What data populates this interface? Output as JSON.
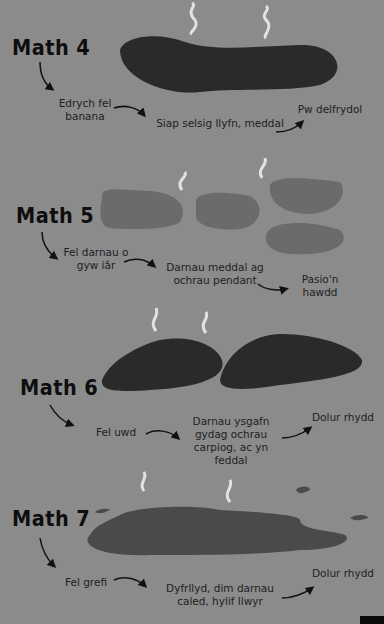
{
  "colors": {
    "background": "#8b8b8b",
    "dark_blob": "#2a2a2a",
    "light_blob": "#6b6b6b",
    "steam": "#e2e2e2",
    "text": "#1e1e1e"
  },
  "sections": [
    {
      "title": "Math 4",
      "labels": [
        "Edrych fel banana",
        "Siap selsig llyfn, meddal",
        "Pw delfrydol"
      ]
    },
    {
      "title": "Math 5",
      "labels": [
        "Fel darnau o gyw iâr",
        "Darnau meddal ag ochrau pendant",
        "Pasio'n hawdd"
      ]
    },
    {
      "title": "Math 6",
      "labels": [
        "Fel uwd",
        "Darnau ysgafn gydag ochrau carpiog, ac yn feddal",
        "Dolur rhydd"
      ]
    },
    {
      "title": "Math 7",
      "labels": [
        "Fel grefi",
        "Dyfrllyd, dim darnau caled, hylif llwyr",
        "Dolur rhydd"
      ]
    }
  ],
  "lines": {
    "m4_l1a": "Edrych fel",
    "m4_l1b": "banana",
    "m4_l2": "Siap selsig llyfn, meddal",
    "m4_l3": "Pw delfrydol",
    "m5_l1a": "Fel darnau o",
    "m5_l1b": "gyw iâr",
    "m5_l2a": "Darnau meddal ag",
    "m5_l2b": "ochrau pendant",
    "m5_l3a": "Pasio'n",
    "m5_l3b": "hawdd",
    "m6_l1": "Fel uwd",
    "m6_l2a": "Darnau ysgafn",
    "m6_l2b": "gydag ochrau",
    "m6_l2c": "carpiog, ac yn",
    "m6_l2d": "feddal",
    "m6_l3": "Dolur rhydd",
    "m7_l1": "Fel grefi",
    "m7_l2a": "Dyfrllyd, dim darnau",
    "m7_l2b": "caled, hylif llwyr",
    "m7_l3": "Dolur rhydd"
  }
}
